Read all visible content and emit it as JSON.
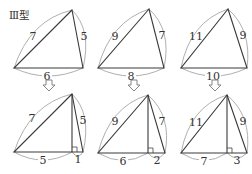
{
  "title": "Ⅲ型",
  "top_row": [
    {
      "sides": {
        "left": "7",
        "right": "5",
        "base": "6"
      }
    },
    {
      "sides": {
        "left": "9",
        "right": "7",
        "base": "8"
      }
    },
    {
      "sides": {
        "left": "11",
        "right": "9",
        "base": "10"
      }
    }
  ],
  "arrow_glyph": "⇩",
  "bottom_row": [
    {
      "sides": {
        "left": "7",
        "right": "5",
        "base_left": "5",
        "base_right": "1"
      }
    },
    {
      "sides": {
        "left": "9",
        "right": "7",
        "base_left": "6",
        "base_right": "2"
      }
    },
    {
      "sides": {
        "left": "11",
        "right": "9",
        "base_left": "7",
        "base_right": "3"
      }
    }
  ]
}
